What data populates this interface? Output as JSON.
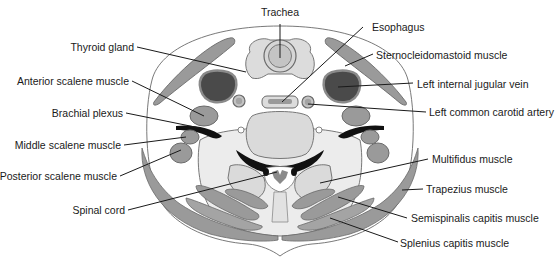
{
  "figure": {
    "labels": {
      "trachea": "Trachea",
      "esophagus": "Esophagus",
      "thyroid_gland": "Thyroid gland",
      "sternocleidomastoid": "Sternocleidomastoid muscle",
      "anterior_scalene": "Anterior scalene muscle",
      "left_internal_jugular": "Left internal jugular vein",
      "brachial_plexus": "Brachial plexus",
      "left_common_carotid": "Left common carotid artery",
      "middle_scalene": "Middle scalene muscle",
      "posterior_scalene": "Posterior scalene muscle",
      "multifidus": "Multifidus muscle",
      "trapezius": "Trapezius muscle",
      "spinal_cord": "Spinal cord",
      "semispinalis_capitis": "Semispinalis capitis muscle",
      "splenius_capitis": "Splenius capitis muscle"
    },
    "colors": {
      "background": "#ffffff",
      "skin_fill": "#ffffff",
      "fascia_fill": "#e6e6e6",
      "muscle_fill": "#9a9a9a",
      "muscle_light": "#b4b4b4",
      "vein_fill": "#4a4a4a",
      "nerve_fill": "#111111",
      "bone_fill": "#d2d2d2",
      "outline": "#6a6a6a",
      "text": "#1a1a1a"
    }
  }
}
